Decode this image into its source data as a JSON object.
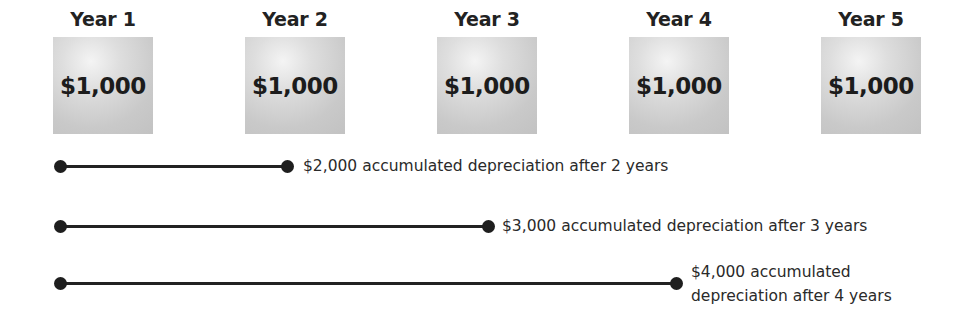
{
  "years": [
    {
      "label": "Year 1",
      "value": "$1,000"
    },
    {
      "label": "Year 2",
      "value": "$1,000"
    },
    {
      "label": "Year 3",
      "value": "$1,000"
    },
    {
      "label": "Year 4",
      "value": "$1,000"
    },
    {
      "label": "Year 5",
      "value": "$1,000"
    }
  ],
  "timelines": [
    {
      "caption": "$2,000 accumulated depreciation after 2 years"
    },
    {
      "caption": "$3,000 accumulated depreciation after 3 years"
    },
    {
      "caption_line1": "$4,000 accumulated",
      "caption_line2": "depreciation after 4 years"
    }
  ],
  "colors": {
    "box_fill": "#c9c9c9",
    "line": "#222222",
    "text": "#1e1e1e"
  }
}
